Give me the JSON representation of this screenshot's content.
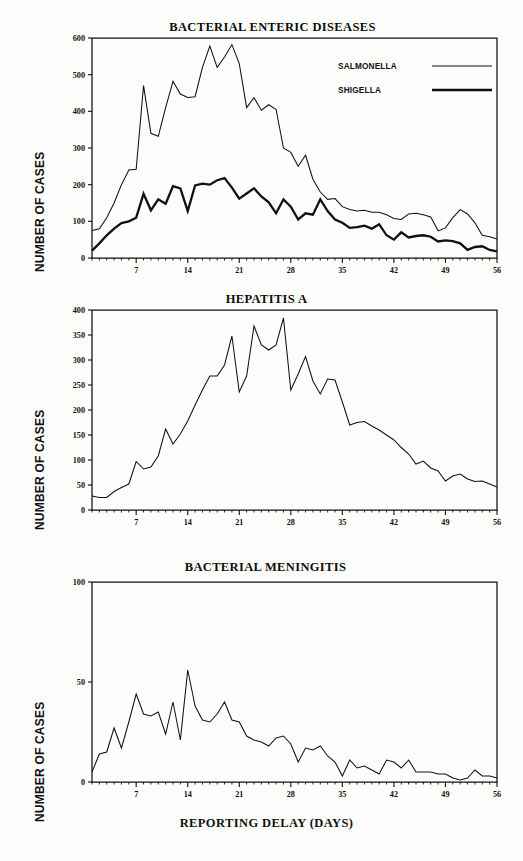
{
  "figure": {
    "background": "#fdfdfc",
    "ink": "#111111"
  },
  "shared": {
    "ylabel": "NUMBER OF CASES",
    "xlabel": "REPORTING DELAY (DAYS)",
    "xticks": [
      7,
      14,
      21,
      28,
      35,
      42,
      49,
      56
    ],
    "xlim": [
      1,
      56
    ]
  },
  "chart_data": [
    {
      "type": "line",
      "title": "BACTERIAL ENTERIC DISEASES",
      "xlabel": "",
      "ylabel": "NUMBER OF CASES",
      "xlim": [
        1,
        56
      ],
      "ylim": [
        0,
        600
      ],
      "yticks": [
        0,
        100,
        200,
        300,
        400,
        500,
        600
      ],
      "xticks": [
        7,
        14,
        21,
        28,
        35,
        42,
        49,
        56
      ],
      "grid": false,
      "legend_position": "top-right",
      "x": [
        1,
        2,
        3,
        4,
        5,
        6,
        7,
        8,
        9,
        10,
        11,
        12,
        13,
        14,
        15,
        16,
        17,
        18,
        19,
        20,
        21,
        22,
        23,
        24,
        25,
        26,
        27,
        28,
        29,
        30,
        31,
        32,
        33,
        34,
        35,
        36,
        37,
        38,
        39,
        40,
        41,
        42,
        43,
        44,
        45,
        46,
        47,
        48,
        49,
        50,
        51,
        52,
        53,
        54,
        55,
        56
      ],
      "series": [
        {
          "name": "SALMONELLA",
          "style": "thin",
          "values": [
            75,
            80,
            110,
            150,
            200,
            240,
            242,
            470,
            340,
            332,
            410,
            482,
            447,
            438,
            440,
            520,
            578,
            520,
            548,
            582,
            530,
            410,
            437,
            403,
            418,
            405,
            300,
            288,
            250,
            280,
            215,
            180,
            160,
            162,
            140,
            132,
            128,
            130,
            125,
            125,
            118,
            108,
            105,
            120,
            122,
            118,
            112,
            74,
            82,
            110,
            132,
            120,
            96,
            62,
            58,
            52
          ]
        },
        {
          "name": "SHIGELLA",
          "style": "thick",
          "values": [
            20,
            40,
            62,
            80,
            95,
            100,
            110,
            175,
            130,
            160,
            148,
            196,
            190,
            128,
            198,
            203,
            200,
            212,
            218,
            192,
            162,
            176,
            190,
            168,
            152,
            122,
            160,
            140,
            105,
            122,
            118,
            160,
            128,
            105,
            96,
            82,
            84,
            88,
            80,
            92,
            62,
            50,
            70,
            56,
            60,
            62,
            58,
            45,
            48,
            46,
            40,
            22,
            30,
            32,
            22,
            18
          ]
        }
      ]
    },
    {
      "type": "line",
      "title": "HEPATITIS A",
      "xlabel": "",
      "ylabel": "NUMBER OF CASES",
      "xlim": [
        1,
        56
      ],
      "ylim": [
        0,
        400
      ],
      "yticks": [
        0,
        50,
        100,
        150,
        200,
        250,
        300,
        350,
        400
      ],
      "xticks": [
        7,
        14,
        21,
        28,
        35,
        42,
        49,
        56
      ],
      "grid": false,
      "legend_position": "none",
      "x": [
        1,
        2,
        3,
        4,
        5,
        6,
        7,
        8,
        9,
        10,
        11,
        12,
        13,
        14,
        15,
        16,
        17,
        18,
        19,
        20,
        21,
        22,
        23,
        24,
        25,
        26,
        27,
        28,
        29,
        30,
        31,
        32,
        33,
        34,
        35,
        36,
        37,
        38,
        39,
        40,
        41,
        42,
        43,
        44,
        45,
        46,
        47,
        48,
        49,
        50,
        51,
        52,
        53,
        54,
        55,
        56
      ],
      "series": [
        {
          "name": "HEPATITIS A",
          "style": "thin",
          "values": [
            28,
            25,
            25,
            37,
            45,
            52,
            97,
            82,
            86,
            108,
            162,
            132,
            152,
            178,
            210,
            240,
            268,
            268,
            290,
            348,
            236,
            268,
            368,
            330,
            320,
            330,
            384,
            240,
            272,
            307,
            258,
            232,
            262,
            260,
            216,
            170,
            175,
            177,
            168,
            160,
            150,
            140,
            125,
            112,
            92,
            98,
            84,
            78,
            58,
            68,
            72,
            62,
            57,
            58,
            52,
            46
          ]
        }
      ]
    },
    {
      "type": "line",
      "title": "BACTERIAL MENINGITIS",
      "xlabel": "REPORTING DELAY (DAYS)",
      "ylabel": "NUMBER OF CASES",
      "xlim": [
        1,
        56
      ],
      "ylim": [
        0,
        100
      ],
      "yticks": [
        0,
        50,
        100
      ],
      "xticks": [
        7,
        14,
        21,
        28,
        35,
        42,
        49,
        56
      ],
      "grid": false,
      "legend_position": "none",
      "x": [
        1,
        2,
        3,
        4,
        5,
        6,
        7,
        8,
        9,
        10,
        11,
        12,
        13,
        14,
        15,
        16,
        17,
        18,
        19,
        20,
        21,
        22,
        23,
        24,
        25,
        26,
        27,
        28,
        29,
        30,
        31,
        32,
        33,
        34,
        35,
        36,
        37,
        38,
        39,
        40,
        41,
        42,
        43,
        44,
        45,
        46,
        47,
        48,
        49,
        50,
        51,
        52,
        53,
        54,
        55,
        56
      ],
      "series": [
        {
          "name": "BACTERIAL MENINGITIS",
          "style": "thin",
          "values": [
            5,
            14,
            15,
            27,
            17,
            30,
            44,
            34,
            33,
            35,
            24,
            40,
            21,
            56,
            38,
            31,
            30,
            34,
            40,
            31,
            30,
            23,
            21,
            20,
            18,
            22,
            23,
            19,
            10,
            17,
            16,
            18,
            13,
            10,
            3,
            11,
            7,
            8,
            6,
            4,
            11,
            10,
            7,
            11,
            5,
            5,
            5,
            4,
            4,
            2,
            1,
            2,
            6,
            3,
            3,
            2
          ]
        }
      ]
    }
  ],
  "legend": {
    "entries": [
      {
        "label": "SALMONELLA",
        "style": "thin"
      },
      {
        "label": "SHIGELLA",
        "style": "thick"
      }
    ]
  }
}
